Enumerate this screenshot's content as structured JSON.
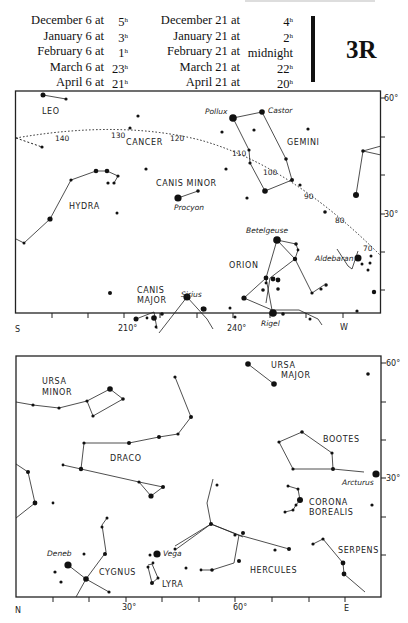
{
  "header": {
    "left_column": [
      {
        "label": "December 6 at",
        "time": "5",
        "unit": "h"
      },
      {
        "label": "January 6 at",
        "time": "3",
        "unit": "h"
      },
      {
        "label": "February 6 at",
        "time": "1",
        "unit": "h"
      },
      {
        "label": "March 6 at",
        "time": "23",
        "unit": "h"
      },
      {
        "label": "April 6 at",
        "time": "21",
        "unit": "h"
      }
    ],
    "right_column": [
      {
        "label": "December 21 at",
        "time": "4",
        "unit": "h"
      },
      {
        "label": "January 21 at",
        "time": "2",
        "unit": "h"
      },
      {
        "label": "February 21 at",
        "time": "midnight",
        "unit": ""
      },
      {
        "label": "March 21 at",
        "time": "22",
        "unit": "h"
      },
      {
        "label": "April 21 at",
        "time": "20",
        "unit": "h"
      }
    ],
    "plate_id": "3R"
  },
  "top_chart": {
    "direction_left": "S",
    "direction_right": "W",
    "x_labels": [
      "210°",
      "240°"
    ],
    "y_labels": [
      "60°",
      "30°"
    ],
    "ecliptic_labels": [
      "140",
      "130",
      "120",
      "110",
      "100",
      "90",
      "80",
      "70"
    ],
    "constellations": [
      "LEO",
      "CANCER",
      "GEMINI",
      "CANIS MINOR",
      "HYDRA",
      "ORION",
      "CANIS",
      "MAJOR"
    ],
    "stars": [
      "Pollux",
      "Castor",
      "Procyon",
      "Betelgeuse",
      "Aldebaran",
      "Sirius",
      "Rigel"
    ]
  },
  "bottom_chart": {
    "direction_left": "N",
    "direction_right": "E",
    "x_labels": [
      "30°",
      "60°"
    ],
    "y_labels": [
      "60°",
      "30°"
    ],
    "constellations": [
      "URSA",
      "MINOR",
      "URSA",
      "MAJOR",
      "DRACO",
      "BOOTES",
      "CORONA",
      "BOREALIS",
      "SERPENS",
      "HERCULES",
      "CYGNUS",
      "LYRA"
    ],
    "stars": [
      "Arcturus",
      "Deneb",
      "Vega"
    ]
  }
}
